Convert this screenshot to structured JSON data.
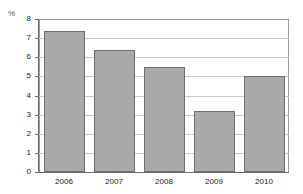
{
  "chart_data": {
    "type": "bar",
    "title": "",
    "subtitle": "",
    "xlabel": "",
    "ylabel": "%",
    "unit_label": "%",
    "categories": [
      "2006",
      "2007",
      "2008",
      "2009",
      "2010"
    ],
    "values": [
      7.35,
      6.4,
      5.5,
      3.2,
      5.0
    ],
    "series": [
      {
        "name": "",
        "values": [
          7.35,
          6.4,
          5.5,
          3.2,
          5.0
        ]
      }
    ],
    "ylim": [
      0,
      8
    ],
    "xlim": [
      0,
      5
    ],
    "ytick_labels": [
      "0",
      "1",
      "2",
      "3",
      "4",
      "5",
      "6",
      "7",
      "8"
    ],
    "ytick_values": [
      0,
      1,
      2,
      3,
      4,
      5,
      6,
      7,
      8
    ],
    "grid": true,
    "grid_axis": "y",
    "legend": false,
    "legend_position": "none",
    "bar_color": "#a9a9a9",
    "bar_border_color": "#6e6e6e",
    "grid_color": "#c9c9c9",
    "axis_color": "#6b6b6b",
    "frame_color": "#9a9a9a",
    "annotations": []
  }
}
